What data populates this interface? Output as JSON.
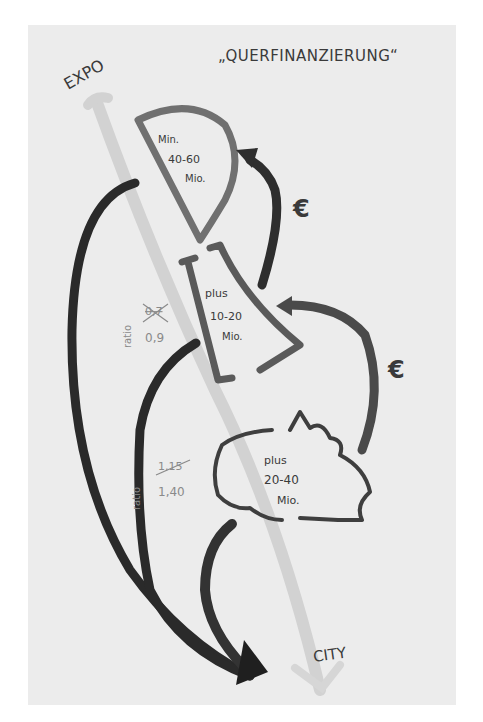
{
  "diagram": {
    "title": "„QUERFINANZIERUNG“",
    "start_label": "EXPO",
    "end_label": "CITY",
    "stages": [
      {
        "shape": "half-circle-wedge",
        "line1": "Min.",
        "line2": "40-60",
        "line3": "Mio."
      },
      {
        "shape": "trapezoid",
        "line1": "plus",
        "line2": "10-20",
        "line3": "Mio."
      },
      {
        "shape": "cloud",
        "line1": "plus",
        "line2": "20-40",
        "line3": "Mio."
      }
    ],
    "flow_symbols": [
      {
        "label": "€"
      },
      {
        "label": "€"
      }
    ],
    "ratio_notes": [
      {
        "label": "ratio",
        "struck_value": "0,7",
        "value": "0,9"
      },
      {
        "label": "ratio",
        "struck_value": "1,15",
        "value": "1,40"
      }
    ],
    "colors": {
      "paper": "#ececec",
      "marker_dark": "#2e2e2e",
      "marker_mid": "#6a6a6a",
      "marker_light": "#c8c8c8",
      "pencil": "#8a8a8a"
    }
  }
}
